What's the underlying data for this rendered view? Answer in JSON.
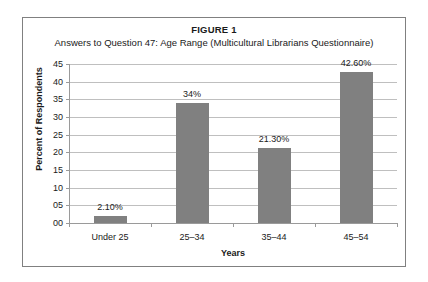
{
  "figure": {
    "label": "FIGURE 1",
    "subtitle": "Answers to Question 47: Age Range (Multicultural Librarians Questionnaire)"
  },
  "colors": {
    "bar": "#808080",
    "gridline": "#bfbfbf",
    "axis": "#9a9a9a",
    "border": "#808080",
    "text": "#1a1a1a",
    "background": "#ffffff"
  },
  "chart_data": {
    "type": "bar",
    "title": "FIGURE 1",
    "subtitle": "Answers to Question 47: Age Range (Multicultural Librarians Questionnaire)",
    "categories": [
      "Under 25",
      "25–34",
      "35–44",
      "45–54"
    ],
    "values": [
      2.1,
      34,
      21.3,
      42.6
    ],
    "data_labels": [
      "2.10%",
      "34%",
      "21.30%",
      "42.60%"
    ],
    "xlabel": "Years",
    "ylabel": "Percent of Respondents",
    "ylim": [
      0,
      45
    ],
    "ytick_labels": [
      "00",
      "05",
      "10",
      "15",
      "20",
      "25",
      "30",
      "35",
      "40",
      "45"
    ],
    "ytick_values": [
      0,
      5,
      10,
      15,
      20,
      25,
      30,
      35,
      40,
      45
    ],
    "grid": true,
    "legend": false,
    "series": [
      {
        "name": "Percent of Respondents",
        "values": [
          2.1,
          34,
          21.3,
          42.6
        ]
      }
    ]
  }
}
